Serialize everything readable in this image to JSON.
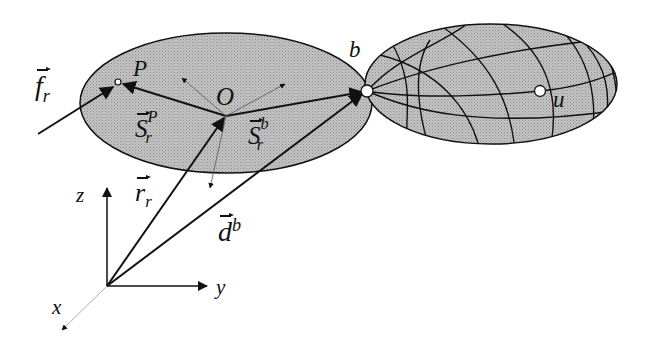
{
  "diagram": {
    "colors": {
      "body_fill": "#b8b8b8",
      "stroke": "#111111",
      "background": "#ffffff"
    },
    "labels": {
      "force": {
        "base": "f",
        "sub": "r"
      },
      "point_P": "P",
      "origin_O": "O",
      "joint_b": "b",
      "point_u": "u",
      "s_rP": {
        "base": "S",
        "sub": "r",
        "sup": "P"
      },
      "s_rb": {
        "base": "S",
        "sub": "r",
        "sup": "b"
      },
      "r_r": {
        "base": "r",
        "sub": "r"
      },
      "d_b": {
        "base": "d",
        "sup": "b"
      },
      "axis_x": "x",
      "axis_y": "y",
      "axis_z": "z"
    }
  }
}
